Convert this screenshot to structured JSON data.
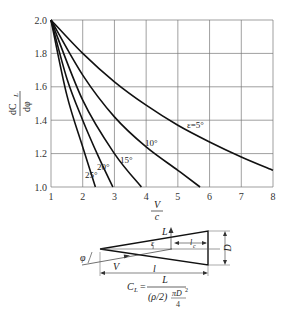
{
  "chart_data": {
    "type": "line",
    "title": "",
    "xlabel": "V/c",
    "ylabel": "dC_L/dφ",
    "xlim": [
      1,
      8
    ],
    "ylim": [
      1.0,
      2.0
    ],
    "grid": true,
    "x_ticks": [
      "1",
      "2",
      "3",
      "4",
      "5",
      "6",
      "7",
      "8"
    ],
    "y_ticks": [
      "1.0",
      "1.2",
      "1.4",
      "1.6",
      "1.8",
      "2.0"
    ],
    "series": [
      {
        "name": "ε=5°",
        "x": [
          1,
          2,
          3,
          4,
          5,
          6,
          7,
          8
        ],
        "values": [
          2.0,
          1.8,
          1.63,
          1.49,
          1.37,
          1.27,
          1.18,
          1.1
        ]
      },
      {
        "name": "10°",
        "x": [
          1,
          2,
          3,
          4,
          5,
          5.7
        ],
        "values": [
          2.0,
          1.67,
          1.42,
          1.24,
          1.1,
          1.0
        ]
      },
      {
        "name": "15°",
        "x": [
          1,
          2,
          3,
          3.85
        ],
        "values": [
          2.0,
          1.52,
          1.2,
          1.0
        ]
      },
      {
        "name": "20°",
        "x": [
          1,
          1.5,
          2,
          2.5,
          2.95
        ],
        "values": [
          2.0,
          1.65,
          1.4,
          1.18,
          1.0
        ]
      },
      {
        "name": "25°",
        "x": [
          1,
          1.5,
          2,
          2.4
        ],
        "values": [
          2.0,
          1.55,
          1.24,
          1.0
        ]
      }
    ],
    "annotations": [
      "ε=5°",
      "10°",
      "15°",
      "20°",
      "25°"
    ]
  },
  "axis": {
    "ylabel_num": "dC",
    "ylabel_sub": "L",
    "ylabel_den": "dφ",
    "xlabel_num": "V",
    "xlabel_den": "c"
  },
  "diagram": {
    "label_L": "L",
    "label_eps": "ε",
    "label_lc": "l",
    "label_lc_sub": "c",
    "label_D": "D",
    "label_phi": "φ",
    "label_V": "V",
    "label_l": "l",
    "formula_lhs": "C",
    "formula_lhs_sub": "L",
    "formula_eq": "=",
    "formula_num": "L",
    "formula_den": "(ρ/2)",
    "formula_den_pi": "πD",
    "formula_den_sq": "2",
    "formula_den_4": "4"
  }
}
